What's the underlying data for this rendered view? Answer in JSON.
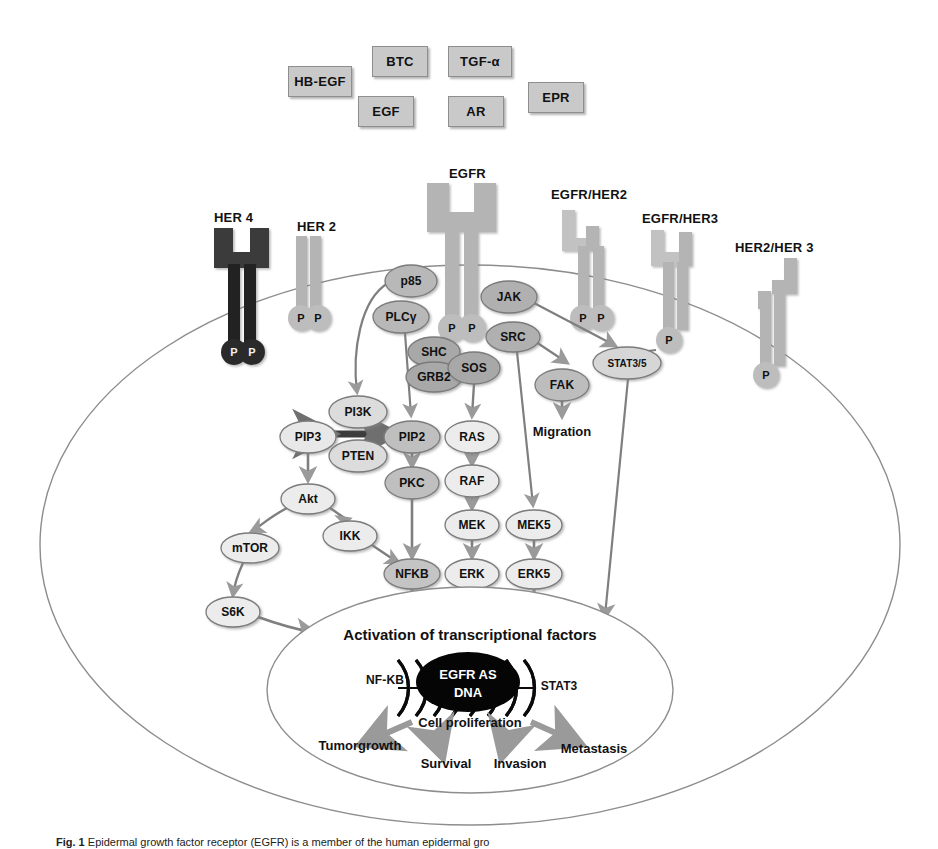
{
  "figure": {
    "caption_prefix": "Fig. 1",
    "caption_text": "Epidermal growth factor receptor (EGFR) is a member of the human epidermal gro"
  },
  "ligands": [
    {
      "label": "HB-EGF",
      "x": 288,
      "y": 66,
      "w": 62,
      "h": 29
    },
    {
      "label": "BTC",
      "x": 372,
      "y": 46,
      "w": 54,
      "h": 29
    },
    {
      "label": "TGF-α",
      "x": 448,
      "y": 46,
      "w": 62,
      "h": 29
    },
    {
      "label": "EGF",
      "x": 358,
      "y": 96,
      "w": 54,
      "h": 29
    },
    {
      "label": "AR",
      "x": 448,
      "y": 96,
      "w": 54,
      "h": 29
    },
    {
      "label": "EPR",
      "x": 528,
      "y": 82,
      "w": 54,
      "h": 29
    }
  ],
  "receptors": [
    {
      "name": "HER 4",
      "label_x": 214,
      "label_y": 210,
      "tone": "dark"
    },
    {
      "name": "HER 2",
      "label_x": 297,
      "label_y": 219,
      "tone": "light"
    },
    {
      "name": "EGFR",
      "label_x": 449,
      "label_y": 166,
      "tone": "light"
    },
    {
      "name": "EGFR/HER2",
      "label_x": 551,
      "label_y": 187,
      "tone": "light"
    },
    {
      "name": "EGFR/HER3",
      "label_x": 642,
      "label_y": 211,
      "tone": "light"
    },
    {
      "name": "HER2/HER  3",
      "label_x": 735,
      "label_y": 240,
      "tone": "light"
    }
  ],
  "phospho_label": "P",
  "nodes": [
    {
      "id": "p85",
      "label": "p85",
      "cx": 411,
      "cy": 281,
      "rx": 26,
      "ry": 16,
      "fill": "#b8b8b8"
    },
    {
      "id": "plcg",
      "label": "PLCγ",
      "cx": 401,
      "cy": 317,
      "rx": 28,
      "ry": 16,
      "fill": "#b8b8b8"
    },
    {
      "id": "jak",
      "label": "JAK",
      "cx": 509,
      "cy": 297,
      "rx": 28,
      "ry": 16,
      "fill": "#b0b0b0"
    },
    {
      "id": "src",
      "label": "SRC",
      "cx": 513,
      "cy": 337,
      "rx": 27,
      "ry": 15,
      "fill": "#b0b0b0"
    },
    {
      "id": "shc",
      "label": "SHC",
      "cx": 434,
      "cy": 352,
      "rx": 26,
      "ry": 15,
      "fill": "#a8a8a8"
    },
    {
      "id": "grb2",
      "label": "GRB2",
      "cx": 434,
      "cy": 377,
      "rx": 28,
      "ry": 15,
      "fill": "#a8a8a8"
    },
    {
      "id": "sos",
      "label": "SOS",
      "cx": 474,
      "cy": 368,
      "rx": 26,
      "ry": 16,
      "fill": "#a8a8a8"
    },
    {
      "id": "fak",
      "label": "FAK",
      "cx": 562,
      "cy": 385,
      "rx": 27,
      "ry": 16,
      "fill": "#bdbdbd"
    },
    {
      "id": "stat35",
      "label": "STAT3/5",
      "cx": 627,
      "cy": 363,
      "rx": 34,
      "ry": 16,
      "fill": "#d6d6d6"
    },
    {
      "id": "pi3k",
      "label": "PI3K",
      "cx": 358,
      "cy": 412,
      "rx": 29,
      "ry": 16,
      "fill": "#dcdcdc"
    },
    {
      "id": "pten",
      "label": "PTEN",
      "cx": 358,
      "cy": 456,
      "rx": 29,
      "ry": 16,
      "fill": "#dcdcdc"
    },
    {
      "id": "pip3",
      "label": "PIP3",
      "cx": 308,
      "cy": 437,
      "rx": 28,
      "ry": 16,
      "fill": "#e8e8e8"
    },
    {
      "id": "pip2",
      "label": "PIP2",
      "cx": 412,
      "cy": 437,
      "rx": 28,
      "ry": 16,
      "fill": "#bfbfbf"
    },
    {
      "id": "ras",
      "label": "RAS",
      "cx": 472,
      "cy": 437,
      "rx": 27,
      "ry": 16,
      "fill": "#ececec"
    },
    {
      "id": "pkc",
      "label": "PKC",
      "cx": 412,
      "cy": 483,
      "rx": 27,
      "ry": 16,
      "fill": "#bfbfbf"
    },
    {
      "id": "raf",
      "label": "RAF",
      "cx": 472,
      "cy": 481,
      "rx": 27,
      "ry": 16,
      "fill": "#ececec"
    },
    {
      "id": "akt",
      "label": "Akt",
      "cx": 308,
      "cy": 499,
      "rx": 27,
      "ry": 15,
      "fill": "#ececec"
    },
    {
      "id": "ikk",
      "label": "IKK",
      "cx": 350,
      "cy": 536,
      "rx": 27,
      "ry": 15,
      "fill": "#ececec"
    },
    {
      "id": "mek",
      "label": "MEK",
      "cx": 472,
      "cy": 525,
      "rx": 27,
      "ry": 15,
      "fill": "#ececec"
    },
    {
      "id": "mek5",
      "label": "MEK5",
      "cx": 534,
      "cy": 525,
      "rx": 28,
      "ry": 15,
      "fill": "#ececec"
    },
    {
      "id": "mtor",
      "label": "mTOR",
      "cx": 250,
      "cy": 548,
      "rx": 29,
      "ry": 15,
      "fill": "#ececec"
    },
    {
      "id": "nfkb",
      "label": "NFKB",
      "cx": 412,
      "cy": 574,
      "rx": 28,
      "ry": 15,
      "fill": "#c4c4c4"
    },
    {
      "id": "erk",
      "label": "ERK",
      "cx": 472,
      "cy": 574,
      "rx": 27,
      "ry": 15,
      "fill": "#ececec"
    },
    {
      "id": "erk5",
      "label": "ERK5",
      "cx": 534,
      "cy": 574,
      "rx": 28,
      "ry": 15,
      "fill": "#ececec"
    },
    {
      "id": "s6k",
      "label": "S6K",
      "cx": 233,
      "cy": 612,
      "rx": 27,
      "ry": 15,
      "fill": "#ececec"
    },
    {
      "id": "nfkb_n",
      "label": "NF-KB",
      "cx": 385,
      "cy": 680,
      "rx": 31,
      "ry": 16,
      "fill": "#cfcfcf"
    },
    {
      "id": "stat3_n",
      "label": "STAT3",
      "cx": 559,
      "cy": 686,
      "rx": 31,
      "ry": 16,
      "fill": "#d8d8d8"
    }
  ],
  "outputs": {
    "migration": "Migration",
    "activation": "Activation of transcriptional factors",
    "dna_line1": "EGFR  AS",
    "dna_line2": "DNA",
    "cell_proliferation": "Cell proliferation",
    "tumor_growth": "Tumorgrowth",
    "survival": "Survival",
    "invasion": "Invasion",
    "metastasis": "Metastasis"
  },
  "colors": {
    "membrane_stroke": "#8d8d8d",
    "nucleus_stroke": "#8d8d8d",
    "arrow_gray": "#9a9a9a",
    "arrow_dark": "#6f6f6f",
    "receptor_light": "#b4b4b4",
    "receptor_dark": "#3a3a3a",
    "ligand_fill": "#c9c9c9",
    "dna_black": "#050505",
    "page_bg": "#ffffff"
  }
}
